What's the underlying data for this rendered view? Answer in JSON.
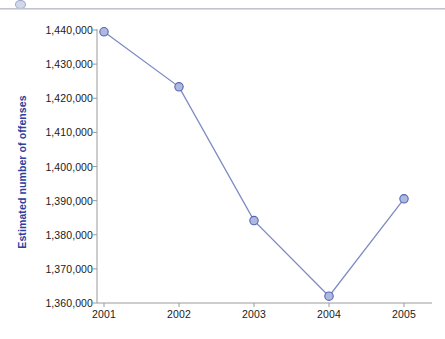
{
  "figure": {
    "background_color": "#ffffff",
    "rule_color": "#c1c4ce",
    "corner_glyph_icon": "partial-marker-icon"
  },
  "chart_data": {
    "type": "line",
    "title": "",
    "xlabel": "",
    "ylabel": "Estimated number of offenses",
    "categories": [
      "2001",
      "2002",
      "2003",
      "2004",
      "2005"
    ],
    "values": [
      1439480,
      1423340,
      1384140,
      1362000,
      1390540
    ],
    "series": [
      {
        "name": "Estimated number of offenses",
        "values": [
          1439480,
          1423340,
          1384140,
          1362000,
          1390540
        ]
      }
    ],
    "ylim": [
      1360000,
      1440000
    ],
    "ytick_values": [
      1360000,
      1370000,
      1380000,
      1390000,
      1400000,
      1410000,
      1420000,
      1430000,
      1440000
    ],
    "ytick_labels": [
      "1,360,000",
      "1,370,000",
      "1,380,000",
      "1,390,000",
      "1,400,000",
      "1,410,000",
      "1,420,000",
      "1,430,000",
      "1,440,000"
    ],
    "xtick_labels": [
      "2001",
      "2002",
      "2003",
      "2004",
      "2005"
    ],
    "grid": false,
    "legend": false,
    "legend_position": "none",
    "line_color": "#7d8ac4",
    "marker_fill_color": "#aeb9e0",
    "marker_edge_color": "#5566b5",
    "axis_color": "#9a9a9a",
    "ylabel_color": "#2b3fa0",
    "tick_label_color": "#1a1a1a"
  }
}
